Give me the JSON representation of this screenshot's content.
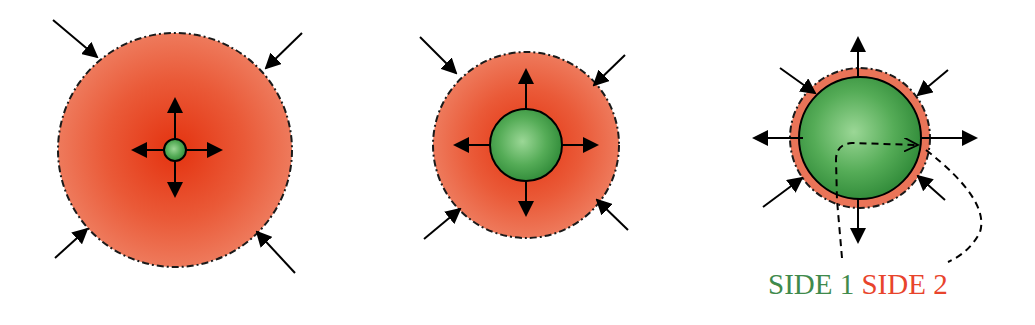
{
  "colors": {
    "outer_fill_center": "#e83a1a",
    "outer_fill_edge": "#ec6e4e",
    "inner_fill_center": "#8ed08a",
    "inner_fill_edge": "#3c9a44",
    "stroke": "#000000",
    "side1": "#3f8a4c",
    "side2": "#e8442c"
  },
  "panels": [
    {
      "id": "stage-1",
      "description": "Large red outer region with tiny green core; outward arrows from core, inward arrows on boundary"
    },
    {
      "id": "stage-2",
      "description": "Medium red outer region with medium green core"
    },
    {
      "id": "stage-3",
      "description": "Thin red shell around large green core with dashed path crossing boundary"
    }
  ],
  "labels": {
    "side1": "SIDE 1",
    "side2": "SIDE 2"
  }
}
